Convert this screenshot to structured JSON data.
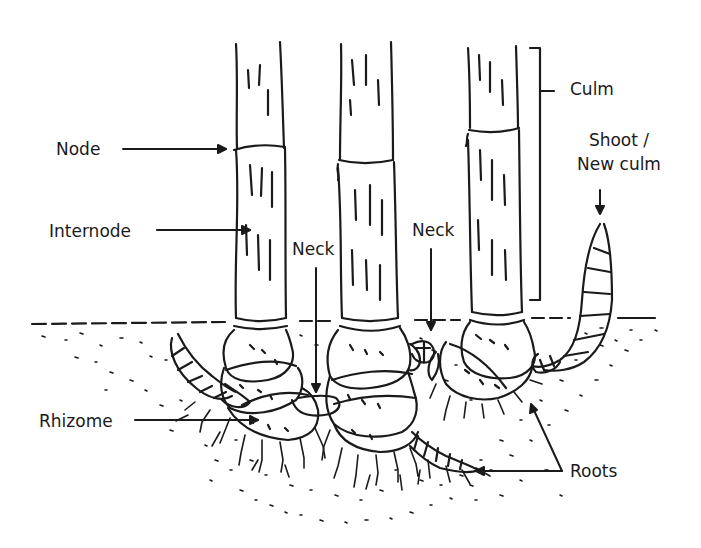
{
  "diagram": {
    "labels": {
      "node": "Node",
      "internode": "Internode",
      "neck_left": "Neck",
      "neck_right": "Neck",
      "culm": "Culm",
      "shoot_line1": "Shoot /",
      "shoot_line2": "New culm",
      "rhizome": "Rhizome",
      "roots": "Roots"
    },
    "colors": {
      "ink": "#1a1a1a",
      "background": "#ffffff"
    }
  }
}
